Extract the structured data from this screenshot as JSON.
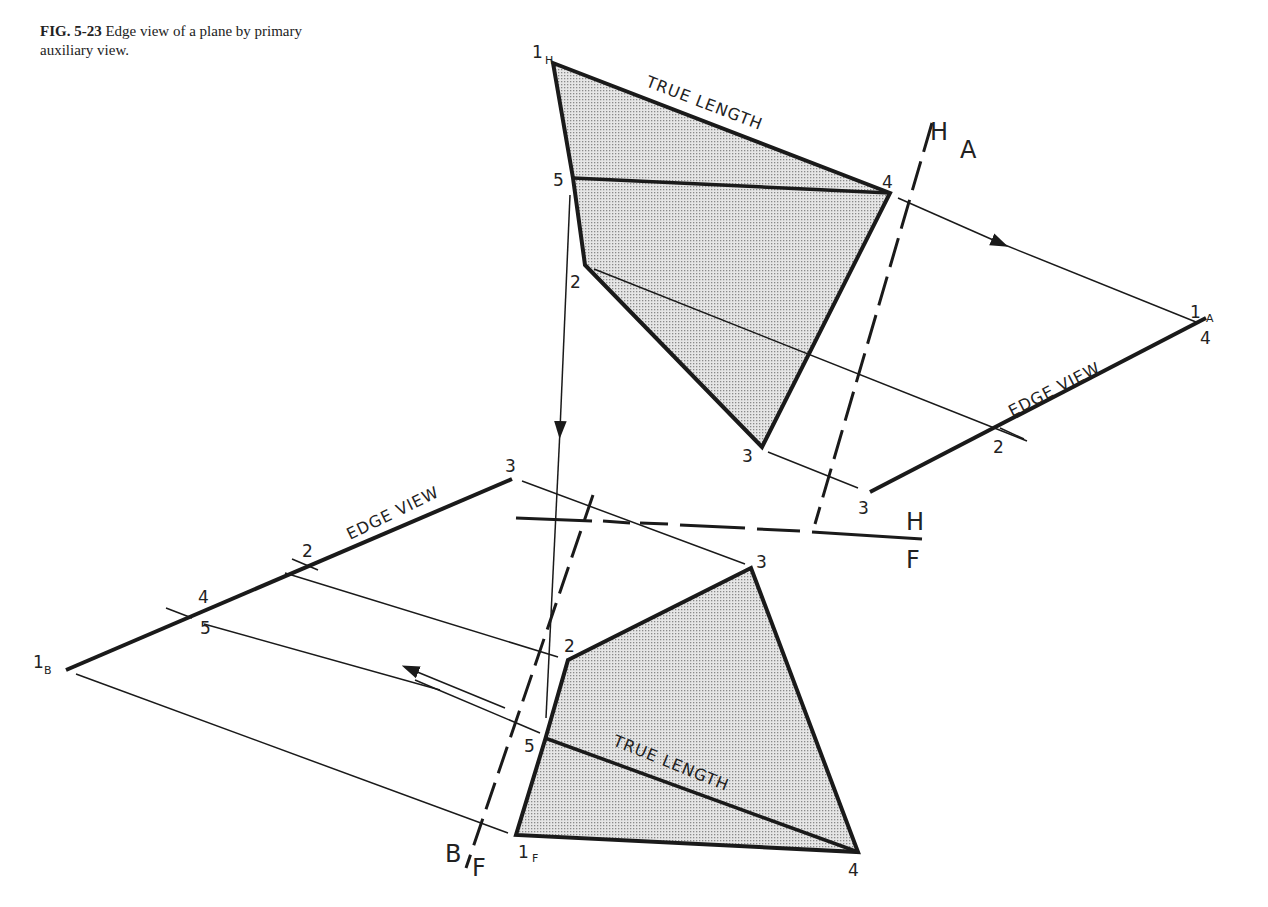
{
  "caption": {
    "figure_number": "FIG. 5-23",
    "text": "Edge view of a plane by primary auxiliary view."
  },
  "annotations": {
    "true_length_top": "TRUE LENGTH",
    "true_length_bottom": "TRUE LENGTH",
    "edge_view_a": "EDGE VIEW",
    "edge_view_b": "EDGE VIEW"
  },
  "fold_lines": {
    "h_a": {
      "top": "H",
      "bottom": "A"
    },
    "h_f": {
      "top": "H",
      "bottom": "F"
    },
    "b_f": {
      "left": "B",
      "right": "F"
    }
  },
  "points": {
    "top_view": {
      "p1": "1",
      "p1_sub": "H",
      "p2": "2",
      "p3": "3",
      "p4": "4",
      "p5": "5"
    },
    "aux_a": {
      "p1": "1",
      "p1_sub": "A",
      "p4": "4",
      "p2": "2",
      "p3": "3"
    },
    "front_view": {
      "p1": "1",
      "p1_sub": "F",
      "p2": "2",
      "p3": "3",
      "p4": "4",
      "p5": "5"
    },
    "aux_b": {
      "p1": "1",
      "p1_sub": "B",
      "p2": "2",
      "p3": "3",
      "p4": "4",
      "p5": "5"
    }
  },
  "colors": {
    "ink": "#1a1a1a",
    "fill_stipple": "#c8c8c8",
    "background": "#ffffff"
  }
}
